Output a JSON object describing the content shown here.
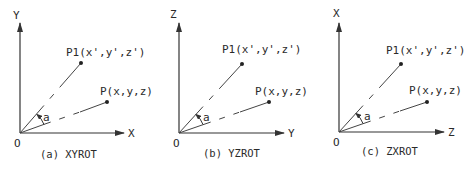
{
  "panels": [
    {
      "id": "a",
      "caption": "(a) XYROT",
      "vertical_axis": "Y",
      "horizontal_axis": "X",
      "origin_label": "O",
      "point_rotated_label": "P1(x',y',z')",
      "point_original_label": "P(x,y,z)",
      "angle_label": "a"
    },
    {
      "id": "b",
      "caption": "(b) YZROT",
      "vertical_axis": "Z",
      "horizontal_axis": "Y",
      "origin_label": "O",
      "point_rotated_label": "P1(x',y',z')",
      "point_original_label": "P(x,y,z)",
      "angle_label": "a"
    },
    {
      "id": "c",
      "caption": "(c) ZXROT",
      "vertical_axis": "X",
      "horizontal_axis": "Z",
      "origin_label": "O",
      "point_rotated_label": "P1(x',y',z')",
      "point_original_label": "P(x,y,z)",
      "angle_label": "a"
    }
  ]
}
